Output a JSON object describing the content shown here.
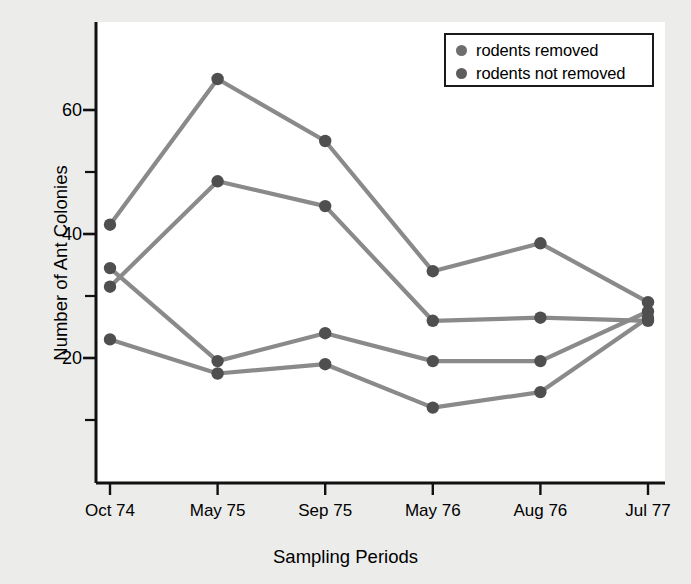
{
  "chart_data": {
    "type": "line",
    "title": "",
    "xlabel": "Sampling Periods",
    "ylabel": "Number of Ant Colonies",
    "categories": [
      "Oct 74",
      "May 75",
      "Sep 75",
      "May 76",
      "Aug 76",
      "Jul 77"
    ],
    "ylim": [
      0,
      68
    ],
    "y_major_ticks": [
      20,
      40,
      60
    ],
    "y_minor_ticks": [
      10,
      30,
      50
    ],
    "y_tick_labels": [
      "20",
      "40",
      "60"
    ],
    "grid": false,
    "legend_position": "top-right",
    "legend": [
      {
        "label": "rodents removed",
        "color": "#6e6e6e"
      },
      {
        "label": "rodents not removed",
        "color": "#5d5d5d"
      }
    ],
    "line_color": "#8a8a8a",
    "marker_color": "#4f4f4f",
    "axis_color": "#111111",
    "plot_background": "#ffffff",
    "figure_background": "#ececeb",
    "series": [
      {
        "name": "rodents removed (plot A)",
        "group": "rodents removed",
        "values": [
          41.5,
          65.0,
          55.0,
          34.0,
          38.5,
          29.0
        ]
      },
      {
        "name": "rodents not removed (plot B)",
        "group": "rodents not removed",
        "values": [
          31.5,
          48.5,
          44.5,
          26.0,
          26.5,
          26.0
        ]
      },
      {
        "name": "rodents removed (plot C)",
        "group": "rodents removed",
        "values": [
          34.5,
          19.5,
          24.0,
          19.5,
          19.5,
          27.5
        ]
      },
      {
        "name": "rodents not removed (plot D)",
        "group": "rodents not removed",
        "values": [
          23.0,
          17.5,
          19.0,
          12.0,
          14.5,
          26.5
        ]
      }
    ]
  },
  "axes": {
    "x_tick_labels": [
      "Oct 74",
      "May 75",
      "Sep 75",
      "May 76",
      "Aug 76",
      "Jul 77"
    ],
    "y_tick_labels": [
      "20",
      "40",
      "60"
    ],
    "x_axis_title": "Sampling Periods",
    "y_axis_title": "Number of Ant Colonies"
  },
  "legend": {
    "items": [
      {
        "label": "rodents removed"
      },
      {
        "label": "rodents not removed"
      }
    ]
  }
}
